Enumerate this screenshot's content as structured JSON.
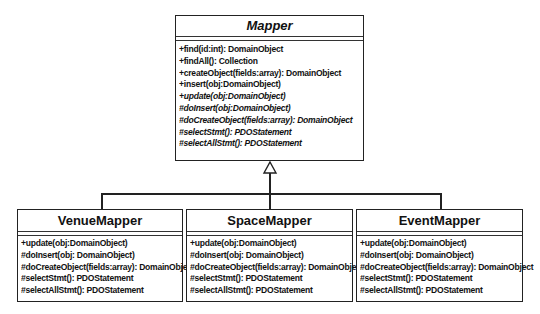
{
  "diagram": {
    "type": "uml-class-inheritance",
    "parent": {
      "name": "Mapper",
      "abstract": true,
      "operations": [
        {
          "text": "+find(id:int): DomainObject",
          "abstract": false
        },
        {
          "text": "+findAll(): Collection",
          "abstract": false
        },
        {
          "text": "+createObject(fields:array): DomainObject",
          "abstract": false
        },
        {
          "text": "+insert(obj:DomainObject)",
          "abstract": false
        },
        {
          "text": "+update(obj:DomainObject)",
          "abstract": true
        },
        {
          "text": "#doInsert(obj:DomainObject)",
          "abstract": true
        },
        {
          "text": "#doCreateObject(fields:array): DomainObject",
          "abstract": true
        },
        {
          "text": "#selectStmt(): PDOStatement",
          "abstract": true
        },
        {
          "text": "#selectAllStmt(): PDOStatement",
          "abstract": true
        }
      ]
    },
    "children": [
      {
        "name": "VenueMapper",
        "operations": [
          "+update(obj:DomainObject)",
          "#doInsert(obj: DomainObject)",
          "#doCreateObject(fields:array): DomainObject",
          "#selectStmt(): PDOStatement",
          "#selectAllStmt(): PDOStatement"
        ]
      },
      {
        "name": "SpaceMapper",
        "operations": [
          "+update(obj:DomainObject)",
          "#doInsert(obj: DomainObject)",
          "#doCreateObject(fields:array): DomainObject",
          "#selectStmt(): PDOStatement",
          "#selectAllStmt(): PDOStatement"
        ]
      },
      {
        "name": "EventMapper",
        "operations": [
          "+update(obj:DomainObject)",
          "#doInsert(obj: DomainObject)",
          "#doCreateObject(fields:array): DomainObject",
          "#selectStmt(): PDOStatement",
          "#selectAllStmt(): PDOStatement"
        ]
      }
    ],
    "relationship": "generalization"
  }
}
